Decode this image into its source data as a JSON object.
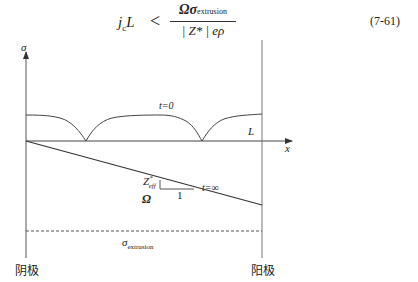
{
  "equation": {
    "lhs": "j",
    "lhs_sub": "c",
    "lhs_tail": "L",
    "relation": "<",
    "numerator": "Ωσ",
    "numerator_sub": "extrusion",
    "denominator": "| Z* | eρ",
    "number": "(7-61)"
  },
  "diagram": {
    "y_axis_label": "σ",
    "x_axis_label": "x",
    "length_label": "L",
    "curve_t0_label": "t=0",
    "curve_tinf_label": "t=∞",
    "slope_label_top": "Z*eff",
    "slope_label_top_main": "Z",
    "slope_label_top_sup": "*",
    "slope_label_top_sub": "eff",
    "slope_label_bottom": "Ω",
    "slope_run_label": "1",
    "threshold_label_main": "σ",
    "threshold_label_sub": "extrusion",
    "cathode_label": "阴极",
    "anode_label": "阳极",
    "line_color": "#444444"
  }
}
